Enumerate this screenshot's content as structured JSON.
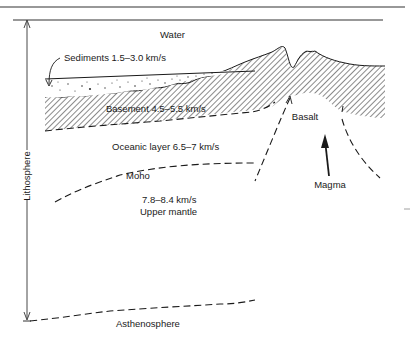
{
  "diagram": {
    "labels": {
      "water": "Water",
      "sediments": "Sediments 1.5–3.0 km/s",
      "basement": "Basement  4.5–5.5 km/s",
      "basalt": "Basalt",
      "oceanic_layer": "Oceanic layer  6.5–7 km/s",
      "moho": "Moho",
      "mantle_velocity": "7.8–8.4 km/s",
      "upper_mantle": "Upper mantle",
      "magma": "Magma",
      "lithosphere": "Lithosphere",
      "asthenosphere": "Asthenosphere"
    },
    "colors": {
      "ink": "#1a1a1a",
      "background": "#ffffff"
    }
  }
}
